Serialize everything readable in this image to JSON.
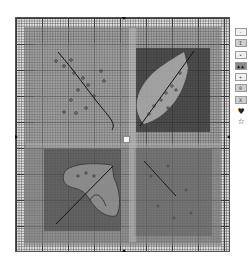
{
  "chart": {
    "type": "cross-stitch pattern",
    "grid": {
      "major_line_every": 10,
      "minor_cell_px": 2.6
    },
    "center_markers": [
      "top",
      "bottom",
      "left",
      "right"
    ],
    "quadrants": [
      {
        "position": "top-left",
        "motif": "curved stem with scattered dots"
      },
      {
        "position": "top-right",
        "motif": "leaf with diagonal midrib on dark square"
      },
      {
        "position": "bottom-left",
        "motif": "heart-shaped leaf with veins"
      },
      {
        "position": "bottom-right",
        "motif": "faint diagonal stem on mid-grey square"
      }
    ],
    "colors": {
      "grid_major": "#3a3a3a",
      "grid_background": "#e4e4e4",
      "dark_fill": "#4a4a4a",
      "mid_fill": "#8c8c8c"
    }
  },
  "legend": {
    "swatches": [
      {
        "symbol": "- -",
        "tone": "light"
      },
      {
        "symbol": "I I",
        "tone": "mid"
      },
      {
        "symbol": "• •",
        "tone": "light"
      },
      {
        "symbol": "▲▲",
        "tone": "dark"
      },
      {
        "symbol": "+ +",
        "tone": "light"
      },
      {
        "symbol": "0 0",
        "tone": "mid"
      },
      {
        "symbol": "X X",
        "tone": "mid"
      }
    ],
    "glyphs": [
      {
        "name": "heart-icon",
        "char": "♥"
      },
      {
        "name": "star-icon",
        "char": "☆"
      }
    ]
  }
}
